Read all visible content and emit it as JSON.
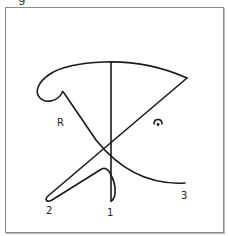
{
  "figure": {
    "caption_fragment": "g",
    "labels": {
      "r": "R",
      "one": "1",
      "two": "2",
      "three": "3"
    },
    "symbol": "fermata",
    "stroke_color": "#1a1a1a",
    "frame_color": "#8a8a8a"
  }
}
